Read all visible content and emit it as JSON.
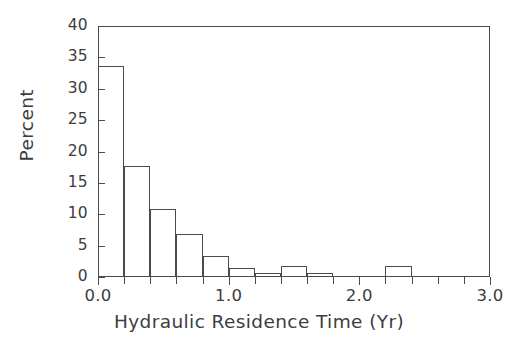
{
  "chart_data": {
    "type": "bar",
    "title": "",
    "subtitle": "",
    "xlabel": "Hydraulic Residence Time (Yr)",
    "ylabel": "Percent",
    "xlim": [
      0.0,
      3.0
    ],
    "ylim": [
      0,
      40
    ],
    "grid": false,
    "legend": null,
    "bin_width": 0.2,
    "x_major_ticks": [
      0.0,
      1.0,
      2.0,
      3.0
    ],
    "x_major_tick_labels": [
      "0.0",
      "1.0",
      "2.0",
      "3.0"
    ],
    "x_minor_ticks": [
      0.2,
      0.4,
      0.6,
      0.8,
      1.2,
      1.4,
      1.6,
      1.8,
      2.2,
      2.4,
      2.6,
      2.8
    ],
    "y_ticks": [
      0,
      5,
      10,
      15,
      20,
      25,
      30,
      35,
      40
    ],
    "y_tick_labels": [
      "0",
      "5",
      "10",
      "15",
      "20",
      "25",
      "30",
      "35",
      "40"
    ],
    "bin_edges": [
      0.0,
      0.2,
      0.4,
      0.6,
      0.8,
      1.0,
      1.2,
      1.4,
      1.6,
      1.8,
      2.0,
      2.2,
      2.4
    ],
    "categories": [
      "0.0-0.2",
      "0.2-0.4",
      "0.4-0.6",
      "0.6-0.8",
      "0.8-1.0",
      "1.0-1.2",
      "1.2-1.4",
      "1.4-1.6",
      "1.6-1.8",
      "1.8-2.0",
      "2.0-2.2",
      "2.2-2.4"
    ],
    "values": [
      33.6,
      17.7,
      10.9,
      6.9,
      3.4,
      1.4,
      0.6,
      1.8,
      0.6,
      0.0,
      0.0,
      1.8
    ],
    "series": [
      {
        "name": "Percent",
        "values": [
          33.6,
          17.7,
          10.9,
          6.9,
          3.4,
          1.4,
          0.6,
          1.8,
          0.6,
          0.0,
          0.0,
          1.8
        ]
      }
    ],
    "colors": {
      "bar_fill": "none",
      "bar_stroke": "#4a4a4a",
      "axis": "#4a4a4a",
      "text": "#3d3d3d",
      "background": "#ffffff"
    }
  }
}
